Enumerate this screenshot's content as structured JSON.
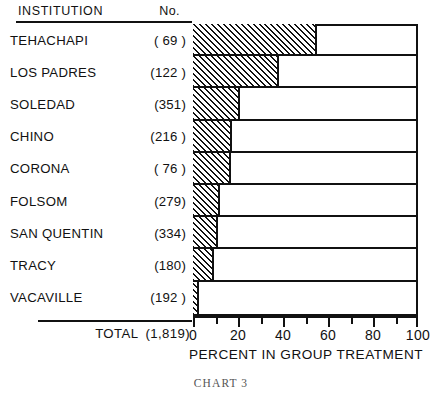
{
  "table": {
    "header": {
      "institution": "INSTITUTION",
      "number": "No."
    },
    "total": {
      "label": "TOTAL",
      "value": "(1,819)"
    }
  },
  "axis": {
    "title": "PERCENT IN GROUP TREATMENT",
    "tick_labels": [
      "0",
      "20",
      "40",
      "60",
      "80",
      "100"
    ]
  },
  "caption": "CHART 3",
  "colors": {
    "ink": "#111111",
    "paper": "#ffffff"
  },
  "chart_data": {
    "type": "bar",
    "orientation": "horizontal",
    "title": "CHART 3",
    "xlabel": "PERCENT IN GROUP TREATMENT",
    "ylabel": "INSTITUTION",
    "xlim": [
      0,
      100
    ],
    "xticks": [
      0,
      20,
      40,
      60,
      80,
      100
    ],
    "minor_tick_step": 10,
    "grid": false,
    "legend": null,
    "total_label": "TOTAL",
    "total_population": 1819,
    "categories": [
      "TEHACHAPI",
      "LOS PADRES",
      "SOLEDAD",
      "CHINO",
      "CORONA",
      "FOLSOM",
      "SAN QUENTIN",
      "TRACY",
      "VACAVILLE"
    ],
    "population_labels": [
      "( 69 )",
      "(122 )",
      "(351)",
      "(216 )",
      "( 76 )",
      "(279)",
      "(334)",
      "(180)",
      "(192 )"
    ],
    "populations": [
      69,
      122,
      351,
      216,
      76,
      279,
      334,
      180,
      192
    ],
    "values": [
      55,
      38,
      21,
      17.5,
      17,
      12,
      11,
      9.5,
      2.5
    ],
    "rows": [
      {
        "institution": "TEHACHAPI",
        "population_label": "( 69 )",
        "population": 69,
        "percent": 55
      },
      {
        "institution": "LOS PADRES",
        "population_label": "(122 )",
        "population": 122,
        "percent": 38
      },
      {
        "institution": "SOLEDAD",
        "population_label": "(351)",
        "population": 351,
        "percent": 21
      },
      {
        "institution": "CHINO",
        "population_label": "(216 )",
        "population": 216,
        "percent": 17.5
      },
      {
        "institution": "CORONA",
        "population_label": "( 76 )",
        "population": 76,
        "percent": 17
      },
      {
        "institution": "FOLSOM",
        "population_label": "(279)",
        "population": 279,
        "percent": 12
      },
      {
        "institution": "SAN QUENTIN",
        "population_label": "(334)",
        "population": 334,
        "percent": 11
      },
      {
        "institution": "TRACY",
        "population_label": "(180)",
        "population": 180,
        "percent": 9.5
      },
      {
        "institution": "VACAVILLE",
        "population_label": "(192 )",
        "population": 192,
        "percent": 2.5
      }
    ]
  }
}
